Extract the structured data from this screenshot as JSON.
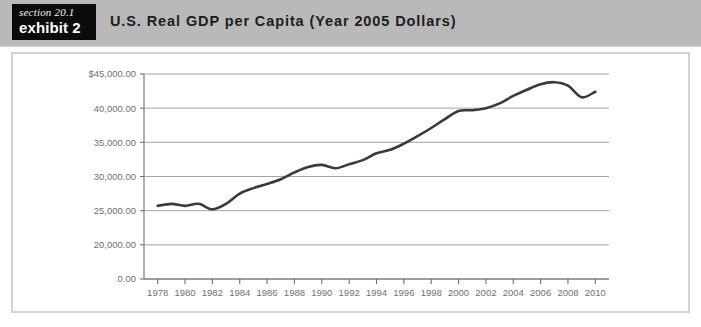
{
  "exhibit": {
    "section_label": "section 20.1",
    "exhibit_label": "exhibit 2",
    "title": "U.S. Real GDP per Capita (Year 2005 Dollars)"
  },
  "colors": {
    "header_band": "#b9b9b9",
    "tag_background": "#0b0b0b",
    "tag_text": "#ffffff",
    "title_text": "#1d1d1d",
    "card_border": "#d2d2d2",
    "plot_background": "#ffffff",
    "gridline": "#9a9a9a",
    "axis": "#6f6f6f",
    "tick_label": "#6f6f6f",
    "series_line": "#3a3a3a"
  },
  "chart_data": {
    "type": "line",
    "title": "U.S. Real GDP per Capita (Year 2005 Dollars)",
    "xlabel": "",
    "ylabel": "",
    "grid": true,
    "legend": "none",
    "xlim": [
      1977,
      2011
    ],
    "ylim": [
      20000,
      45000
    ],
    "y_axis_break": true,
    "y_tick_labels": [
      "$45,000.00",
      "40,000.00",
      "35,000.00",
      "30,000.00",
      "25,000.00",
      "20,000.00",
      "0.00"
    ],
    "y_tick_values": [
      45000,
      40000,
      35000,
      30000,
      25000,
      20000,
      0
    ],
    "x_tick_labels": [
      "1978",
      "1980",
      "1982",
      "1984",
      "1986",
      "1988",
      "1990",
      "1992",
      "1994",
      "1996",
      "1998",
      "2000",
      "2002",
      "2004",
      "2006",
      "2008",
      "2010"
    ],
    "x_tick_values": [
      1978,
      1980,
      1982,
      1984,
      1986,
      1988,
      1990,
      1992,
      1994,
      1996,
      1998,
      2000,
      2002,
      2004,
      2006,
      2008,
      2010
    ],
    "series": [
      {
        "name": "U.S. Real GDP per Capita",
        "x": [
          1978,
          1979,
          1980,
          1981,
          1982,
          1983,
          1984,
          1985,
          1986,
          1987,
          1988,
          1989,
          1990,
          1991,
          1992,
          1993,
          1994,
          1995,
          1996,
          1997,
          1998,
          1999,
          2000,
          2001,
          2002,
          2003,
          2004,
          2005,
          2006,
          2007,
          2008,
          2009,
          2010
        ],
        "values": [
          25700,
          26000,
          25700,
          26000,
          25200,
          26000,
          27500,
          28300,
          28900,
          29600,
          30600,
          31400,
          31700,
          31200,
          31800,
          32400,
          33400,
          33900,
          34800,
          35900,
          37100,
          38400,
          39600,
          39700,
          40000,
          40700,
          41800,
          42700,
          43500,
          43800,
          43300,
          41600,
          42400
        ]
      }
    ]
  }
}
